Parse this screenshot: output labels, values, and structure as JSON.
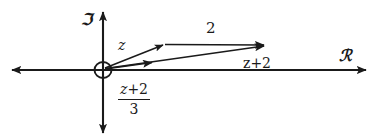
{
  "figure": {
    "background_color": "#ffffff",
    "stroke_color": "#1a1a1a",
    "width": 377,
    "height": 140
  },
  "axes": {
    "imaginary": {
      "label": "ℑ",
      "name": "imaginary-axis",
      "orientation": "vertical",
      "double_headed": true
    },
    "real": {
      "label": "ℛ",
      "name": "real-axis",
      "orientation": "horizontal",
      "double_headed": true
    },
    "origin": {
      "label": "",
      "marker": "circle"
    }
  },
  "vectors": [
    {
      "id": "z",
      "label": "z",
      "from": "origin",
      "to": "z-tip",
      "description": "vector z drawn from the origin up and to the right"
    },
    {
      "id": "two",
      "label": "2",
      "from": "z-tip",
      "to": "sum-tip",
      "description": "horizontal vector of length 2 appended to the tip of z"
    },
    {
      "id": "z-plus-2",
      "label": "z+2",
      "from": "origin",
      "to": "sum-tip",
      "description": "resultant vector z plus 2 from the origin"
    },
    {
      "id": "z-plus-2-over-3",
      "label_numerator": "z+2",
      "label_denominator": "3",
      "from": "origin",
      "to": "third-tip",
      "description": "short vector equal to one third of z plus 2"
    }
  ],
  "labels": {
    "imaginary_axis": "ℑ",
    "real_axis": "ℛ",
    "z": "z",
    "two": "2",
    "z_plus_2": "z+2",
    "fraction_numerator_var": "z",
    "fraction_numerator_op": "+2",
    "fraction_denominator": "3"
  }
}
